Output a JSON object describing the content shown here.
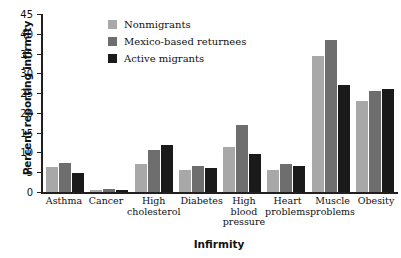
{
  "chart_data": {
    "type": "bar",
    "title": "",
    "xlabel": "Infirmity",
    "ylabel": "Percent reporting infirmity",
    "ylim": [
      0,
      45
    ],
    "yticks": [
      0,
      5,
      10,
      15,
      20,
      25,
      30,
      35,
      40,
      45
    ],
    "grid": false,
    "legend_position": "top-center",
    "categories": [
      "Asthma",
      "Cancer",
      "High cholesterol",
      "Diabetes",
      "High blood pressure",
      "Heart problems",
      "Muscle problems",
      "Obesity"
    ],
    "series": [
      {
        "name": "Nonmigrants",
        "color": "#a8a8a8",
        "values": [
          6.3,
          0.5,
          7.0,
          5.5,
          11.5,
          5.5,
          34.5,
          23.0
        ]
      },
      {
        "name": "Mexico-based returnees",
        "color": "#6e6e6e",
        "values": [
          7.3,
          0.8,
          10.5,
          6.5,
          17.0,
          7.0,
          38.5,
          25.5
        ]
      },
      {
        "name": "Active migrants",
        "color": "#1a1a1a",
        "values": [
          4.8,
          0.4,
          12.0,
          6.0,
          9.5,
          6.5,
          27.0,
          26.0
        ]
      }
    ]
  },
  "colors": {
    "axis": "#231f20",
    "text": "#111111",
    "background": "#ffffff"
  }
}
